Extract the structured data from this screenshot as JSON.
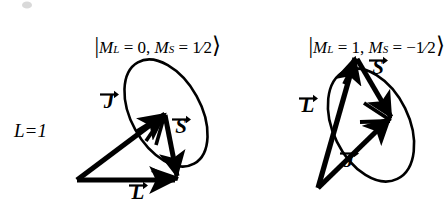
{
  "figure": {
    "background_color": "#ffffff",
    "ink_color": "#000000",
    "width": 440,
    "height": 213
  },
  "state_label": {
    "text": "L=1",
    "symbol": "L",
    "equals": "=",
    "value": "1"
  },
  "panels": [
    {
      "id": "left",
      "ket": {
        "full": "|M_L = 0, M_S = 1/2⟩",
        "open_bar": "|",
        "m_l_symbol": "M",
        "m_l_sub": "L",
        "m_l_eq": " = ",
        "m_l_value": "0",
        "separator": ", ",
        "m_s_symbol": "M",
        "m_s_sub": "S",
        "m_s_eq": " = ",
        "m_s_value": "1/2",
        "m_s_numerator": "1",
        "m_s_slash": "⁄",
        "m_s_denominator": "2",
        "close_bracket": "⟩"
      },
      "vectors": [
        {
          "name": "L",
          "label": "L",
          "arrow_over": true
        },
        {
          "name": "S",
          "label": "S",
          "arrow_over": true
        },
        {
          "name": "J",
          "label": "J",
          "arrow_over": true
        }
      ],
      "cone_ellipse": true
    },
    {
      "id": "right",
      "ket": {
        "full": "|M_L = 1, M_S = −1/2⟩",
        "open_bar": "|",
        "m_l_symbol": "M",
        "m_l_sub": "L",
        "m_l_eq": " = ",
        "m_l_value": "1",
        "separator": ", ",
        "m_s_symbol": "M",
        "m_s_sub": "S",
        "m_s_eq": " = ",
        "m_s_value": "−1/2",
        "m_s_minus": "−",
        "m_s_numerator": "1",
        "m_s_slash": "⁄",
        "m_s_denominator": "2",
        "close_bracket": "⟩"
      },
      "vectors": [
        {
          "name": "L",
          "label": "L",
          "arrow_over": true
        },
        {
          "name": "S",
          "label": "S",
          "arrow_over": true
        },
        {
          "name": "J",
          "label": "J",
          "arrow_over": true
        }
      ],
      "cone_ellipse": true
    }
  ]
}
